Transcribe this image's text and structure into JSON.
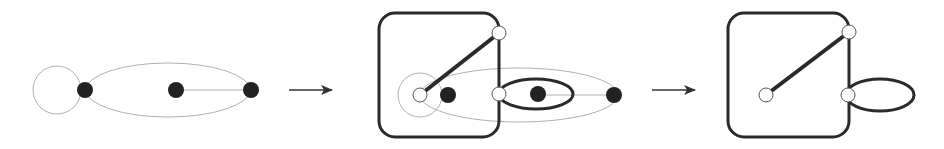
{
  "diagram": {
    "colors": {
      "thin_edge": "#b0b0b0",
      "thick_edge": "#2a2a2a",
      "black_node": "#222222",
      "hollow_node_fill": "#ffffff",
      "hollow_node_stroke": "#555555",
      "arrow": "#333333"
    },
    "stages": [
      {
        "id": "stage-1",
        "nodes": [
          "black-left",
          "black-middle",
          "black-right"
        ],
        "edges": [
          "loop-left",
          "ellipse-outer",
          "line-middle-right"
        ]
      },
      {
        "id": "stage-2",
        "nodes": [
          "hollow-center",
          "hollow-top",
          "hollow-right",
          "black-inner",
          "black-middle",
          "black-right"
        ],
        "edges": [
          "rounded-box",
          "thick-diagonal",
          "thick-ellipse",
          "thin-ellipses"
        ]
      },
      {
        "id": "stage-3",
        "nodes": [
          "hollow-center",
          "hollow-top",
          "hollow-right"
        ],
        "edges": [
          "rounded-box",
          "thick-diagonal",
          "thick-loop"
        ]
      }
    ],
    "arrows": 2
  }
}
